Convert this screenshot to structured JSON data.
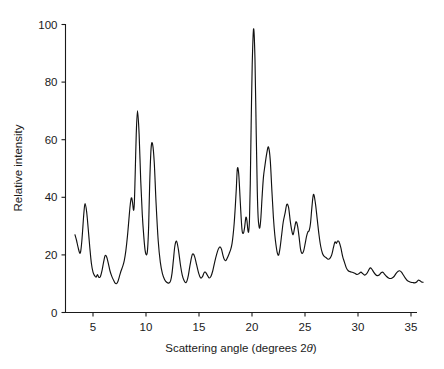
{
  "chart_data": {
    "type": "line",
    "title": "",
    "xlabel": "Scattering angle (degrees 2θ)",
    "ylabel": "Relative intensity",
    "xlabel_main": "Scattering angle (degrees 2",
    "xlabel_italic": "θ",
    "xlabel_tail": ")",
    "xlim": [
      3.0,
      36.2
    ],
    "ylim": [
      0,
      104
    ],
    "xticks": [
      5,
      10,
      15,
      20,
      25,
      30,
      35
    ],
    "xtick_labels": [
      "5",
      "10",
      "15",
      "20",
      "25",
      "30",
      "35"
    ],
    "yticks": [
      0,
      20,
      40,
      60,
      80,
      100
    ],
    "ytick_labels": [
      "0",
      "20",
      "40",
      "60",
      "80",
      "100"
    ],
    "grid": false,
    "legend": "none",
    "line_color": "#111111",
    "series": [
      {
        "name": "X-ray diffractogram",
        "x": [
          3.3,
          3.45,
          3.6,
          3.75,
          3.85,
          3.95,
          4.05,
          4.15,
          4.25,
          4.4,
          4.55,
          4.7,
          4.85,
          5.0,
          5.15,
          5.3,
          5.42,
          5.55,
          5.7,
          5.85,
          6.0,
          6.15,
          6.3,
          6.45,
          6.6,
          6.75,
          6.9,
          7.05,
          7.2,
          7.35,
          7.5,
          7.65,
          7.8,
          7.95,
          8.1,
          8.25,
          8.38,
          8.5,
          8.62,
          8.72,
          8.82,
          8.9,
          8.98,
          9.08,
          9.2,
          9.35,
          9.5,
          9.65,
          9.8,
          9.92,
          10.05,
          10.15,
          10.25,
          10.35,
          10.48,
          10.62,
          10.78,
          10.95,
          11.15,
          11.35,
          11.55,
          11.75,
          11.95,
          12.15,
          12.32,
          12.45,
          12.58,
          12.72,
          12.88,
          13.05,
          13.25,
          13.42,
          13.58,
          13.72,
          13.85,
          14.0,
          14.18,
          14.38,
          14.58,
          14.78,
          14.98,
          15.15,
          15.32,
          15.48,
          15.62,
          15.78,
          15.95,
          16.12,
          16.3,
          16.48,
          16.65,
          16.82,
          16.98,
          17.12,
          17.25,
          17.38,
          17.52,
          17.68,
          17.85,
          18.0,
          18.12,
          18.22,
          18.32,
          18.42,
          18.52,
          18.62,
          18.75,
          18.9,
          19.05,
          19.18,
          19.3,
          19.42,
          19.52,
          19.6,
          19.68,
          19.76,
          19.84,
          19.92,
          20.02,
          20.15,
          20.28,
          20.4,
          20.5,
          20.58,
          20.66,
          20.74,
          20.84,
          20.95,
          21.08,
          21.22,
          21.38,
          21.55,
          21.72,
          21.88,
          22.02,
          22.15,
          22.28,
          22.4,
          22.52,
          22.65,
          22.8,
          22.95,
          23.12,
          23.28,
          23.45,
          23.6,
          23.75,
          23.88,
          24.0,
          24.15,
          24.3,
          24.45,
          24.58,
          24.72,
          24.88,
          25.02,
          25.15,
          25.28,
          25.4,
          25.52,
          25.65,
          25.8,
          25.98,
          26.15,
          26.32,
          26.48,
          26.65,
          26.82,
          27.0,
          27.18,
          27.35,
          27.52,
          27.68,
          27.82,
          27.95,
          28.08,
          28.22,
          28.38,
          28.55,
          28.72,
          28.9,
          29.08,
          29.25,
          29.42,
          29.58,
          29.75,
          29.92,
          30.1,
          30.28,
          30.45,
          30.62,
          30.8,
          30.98,
          31.15,
          31.32,
          31.48,
          31.65,
          31.82,
          32.0,
          32.18,
          32.35,
          32.52,
          32.7,
          32.88,
          33.05,
          33.22,
          33.4,
          33.58,
          33.75,
          33.92,
          34.1,
          34.28,
          34.45,
          34.62,
          34.8,
          34.98,
          35.15,
          35.32,
          35.5,
          35.68,
          35.85,
          36.0,
          36.15
        ],
        "y": [
          27.0,
          25.0,
          22.5,
          20.6,
          21.5,
          25.0,
          30.0,
          35.0,
          37.8,
          35.0,
          29.0,
          22.5,
          17.0,
          14.0,
          12.8,
          12.3,
          13.2,
          12.2,
          12.5,
          14.5,
          17.5,
          19.8,
          19.2,
          17.0,
          14.5,
          12.8,
          11.5,
          10.4,
          10.0,
          10.8,
          12.6,
          14.5,
          16.0,
          18.0,
          21.5,
          26.5,
          32.0,
          37.0,
          39.8,
          38.5,
          35.5,
          38.0,
          48.0,
          62.0,
          70.0,
          62.0,
          46.0,
          34.0,
          26.0,
          21.5,
          20.0,
          22.0,
          30.0,
          45.0,
          57.0,
          58.5,
          52.0,
          38.0,
          25.0,
          17.5,
          13.5,
          11.5,
          10.5,
          10.2,
          11.0,
          13.5,
          18.0,
          23.0,
          24.8,
          22.0,
          16.5,
          13.0,
          11.2,
          10.4,
          10.8,
          13.0,
          17.0,
          20.2,
          19.5,
          16.5,
          13.5,
          12.0,
          12.4,
          13.8,
          14.0,
          13.0,
          12.0,
          12.5,
          14.5,
          17.5,
          20.0,
          22.0,
          22.8,
          22.0,
          20.0,
          18.5,
          18.0,
          19.0,
          20.5,
          22.0,
          24.0,
          27.0,
          31.0,
          36.5,
          43.0,
          50.0,
          48.0,
          38.0,
          29.0,
          27.5,
          29.5,
          33.0,
          32.0,
          29.0,
          28.0,
          32.0,
          45.0,
          65.0,
          86.0,
          98.5,
          88.0,
          62.0,
          42.0,
          33.0,
          30.0,
          29.5,
          33.0,
          40.0,
          47.0,
          51.0,
          55.0,
          57.5,
          53.0,
          42.0,
          33.0,
          27.0,
          23.0,
          20.5,
          20.0,
          22.5,
          27.0,
          31.5,
          34.5,
          37.5,
          36.5,
          32.0,
          28.5,
          27.0,
          29.0,
          31.5,
          30.0,
          26.0,
          22.0,
          20.5,
          21.5,
          24.0,
          26.5,
          28.0,
          28.5,
          31.0,
          36.5,
          41.0,
          38.0,
          32.5,
          27.0,
          23.0,
          20.5,
          19.5,
          19.0,
          18.5,
          18.8,
          20.0,
          22.5,
          24.5,
          24.0,
          24.8,
          24.5,
          22.5,
          19.5,
          17.5,
          15.5,
          14.5,
          14.2,
          14.0,
          13.8,
          13.5,
          13.2,
          13.5,
          14.0,
          13.5,
          13.0,
          13.4,
          14.5,
          15.5,
          15.0,
          14.0,
          13.2,
          12.8,
          13.0,
          13.8,
          14.0,
          13.2,
          12.5,
          12.0,
          11.8,
          12.0,
          12.5,
          13.5,
          14.2,
          14.5,
          14.0,
          13.0,
          12.0,
          11.2,
          10.8,
          10.5,
          10.4,
          10.3,
          10.5,
          11.2,
          11.0,
          10.6,
          10.5
        ]
      }
    ]
  },
  "axes": {
    "y_axis_name": "relative-intensity-axis",
    "x_axis_name": "scattering-angle-axis"
  }
}
